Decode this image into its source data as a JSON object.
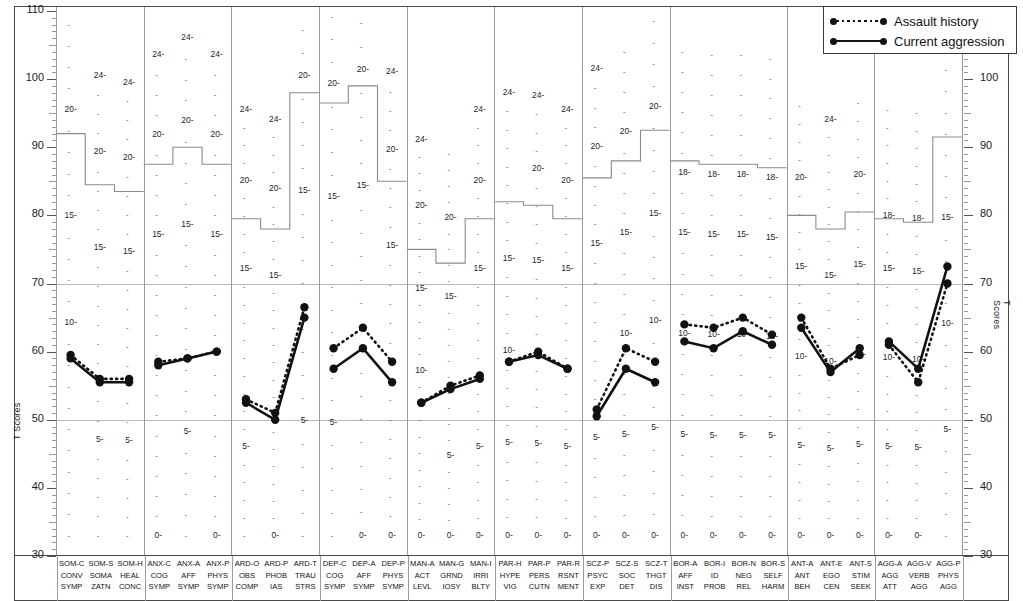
{
  "chart_data": {
    "type": "line",
    "title": "",
    "xlabel": "",
    "ylabel": "T Scores",
    "ylim": [
      30,
      110
    ],
    "grid": false,
    "legend_position": "top-right",
    "y_axis_left_ticks": [
      110,
      100,
      90,
      80,
      70,
      60,
      50,
      40,
      30
    ],
    "y_axis_right_ticks": [
      100,
      90,
      80,
      70,
      60,
      50,
      40,
      30
    ],
    "reference_lines": [
      50,
      70
    ],
    "categories": [
      "SOM-C",
      "SOM-S",
      "SOM-H",
      "ANX-C",
      "ANX-A",
      "ANX-P",
      "ARD-O",
      "ARD-P",
      "ARD-T",
      "DEP-C",
      "DEP-A",
      "DEP-P",
      "MAN-A",
      "MAN-G",
      "MAN-I",
      "PAR-H",
      "PAR-P",
      "PAR-R",
      "SCZ-P",
      "SCZ-S",
      "SCZ-T",
      "BOR-A",
      "BOR-I",
      "BOR-N",
      "BOR-S",
      "ANT-A",
      "ANT-E",
      "ANT-S",
      "AGG-A",
      "AGG-V",
      "AGG-P"
    ],
    "series": [
      {
        "name": "Assault history",
        "style": "dotted",
        "values": [
          59.5,
          56.0,
          56.0,
          58.5,
          59.0,
          60.0,
          53.0,
          51.0,
          66.5,
          60.5,
          63.5,
          58.5,
          52.5,
          55.0,
          56.5,
          58.5,
          60.0,
          57.5,
          51.5,
          60.5,
          58.5,
          64.0,
          63.5,
          65.0,
          62.5,
          65.0,
          57.5,
          59.5,
          61.0,
          55.5,
          70.0
        ]
      },
      {
        "name": "Current aggression",
        "style": "solid",
        "values": [
          59.0,
          55.5,
          55.5,
          58.0,
          59.0,
          60.0,
          52.5,
          50.0,
          65.0,
          57.5,
          60.5,
          55.5,
          52.5,
          54.5,
          56.0,
          58.5,
          59.5,
          57.5,
          50.5,
          57.5,
          55.5,
          61.5,
          60.5,
          63.0,
          61.0,
          63.5,
          57.0,
          60.5,
          61.5,
          57.5,
          72.5
        ]
      }
    ]
  },
  "legend": {
    "items": [
      {
        "label": "Assault history",
        "style": "dotted"
      },
      {
        "label": "Current aggression",
        "style": "solid"
      }
    ]
  },
  "axis": {
    "left_caption": "T Scores",
    "right_caption": "T Scores",
    "left_labels": [
      "110",
      "100",
      "90",
      "80",
      "70",
      "60",
      "50",
      "40",
      "30"
    ],
    "right_labels": [
      "100",
      "90",
      "80",
      "70",
      "60",
      "50",
      "40",
      "30"
    ]
  },
  "groups": [
    {
      "code": "SOM",
      "scales": [
        {
          "abbr": "SOM-C",
          "l1": "CONV",
          "l2": "SYMP",
          "raw_max": 24,
          "raw_labels": [
            10,
            15,
            20
          ],
          "skyline_t": 92.0
        },
        {
          "abbr": "SOM-S",
          "l1": "SOMA",
          "l2": "ZATN",
          "raw_max": 24,
          "raw_labels": [
            5,
            15,
            20,
            24
          ],
          "skyline_t": 84.5
        },
        {
          "abbr": "SOM-H",
          "l1": "HEAL",
          "l2": "CONC",
          "raw_max": 24,
          "raw_labels": [
            5,
            15,
            20,
            24
          ],
          "skyline_t": 83.5
        }
      ]
    },
    {
      "code": "ANX",
      "scales": [
        {
          "abbr": "ANX-C",
          "l1": "COG",
          "l2": "SYMP",
          "raw_max": 24,
          "raw_labels": [
            0,
            15,
            20,
            24
          ],
          "skyline_t": 87.5
        },
        {
          "abbr": "ANX-A",
          "l1": "AFF",
          "l2": "SYMP",
          "raw_max": 24,
          "raw_labels": [
            5,
            15,
            20,
            24
          ],
          "skyline_t": 90.0
        },
        {
          "abbr": "ANX-P",
          "l1": "PHYS",
          "l2": "SYMP",
          "raw_max": 24,
          "raw_labels": [
            0,
            15,
            20,
            24
          ],
          "skyline_t": 87.5
        }
      ]
    },
    {
      "code": "ARD",
      "scales": [
        {
          "abbr": "ARD-O",
          "l1": "OBS",
          "l2": "COMP",
          "raw_max": 24,
          "raw_labels": [
            5,
            15,
            20,
            24
          ],
          "skyline_t": 79.5
        },
        {
          "abbr": "ARD-P",
          "l1": "PHOB",
          "l2": "IAS",
          "raw_max": 24,
          "raw_labels": [
            0,
            15,
            20,
            24
          ],
          "skyline_t": 78.0
        },
        {
          "abbr": "ARD-T",
          "l1": "TRAU",
          "l2": "STRS",
          "raw_max": 24,
          "raw_labels": [
            5,
            15,
            20,
            24
          ],
          "skyline_t": 98.0
        }
      ]
    },
    {
      "code": "DEP",
      "scales": [
        {
          "abbr": "DEP-C",
          "l1": "COG",
          "l2": "SYMP",
          "raw_max": 24,
          "raw_labels": [
            5,
            15,
            20,
            24
          ],
          "skyline_t": 96.5
        },
        {
          "abbr": "DEP-A",
          "l1": "AFF",
          "l2": "SYMP",
          "raw_max": 24,
          "raw_labels": [
            0,
            15,
            20,
            24
          ],
          "skyline_t": 99.0
        },
        {
          "abbr": "DEP-P",
          "l1": "PHYS",
          "l2": "SYMP",
          "raw_max": 24,
          "raw_labels": [
            0,
            15,
            20,
            24
          ],
          "skyline_t": 85.0
        }
      ]
    },
    {
      "code": "MAN",
      "scales": [
        {
          "abbr": "MAN-A",
          "l1": "ACT",
          "l2": "LEVL",
          "raw_max": 24,
          "raw_labels": [
            0,
            10,
            15,
            20,
            24
          ],
          "skyline_t": 75.0
        },
        {
          "abbr": "MAN-G",
          "l1": "GRND",
          "l2": "IOSY",
          "raw_max": 24,
          "raw_labels": [
            0,
            5,
            15,
            20
          ],
          "skyline_t": 73.0
        },
        {
          "abbr": "MAN-I",
          "l1": "IRRI",
          "l2": "BLTY",
          "raw_max": 24,
          "raw_labels": [
            0,
            5,
            15,
            20,
            24
          ],
          "skyline_t": 79.5
        }
      ]
    },
    {
      "code": "PAR",
      "scales": [
        {
          "abbr": "PAR-H",
          "l1": "HYPE",
          "l2": "VIG",
          "raw_max": 24,
          "raw_labels": [
            0,
            5,
            10,
            15,
            24
          ],
          "skyline_t": 82.0
        },
        {
          "abbr": "PAR-P",
          "l1": "PERS",
          "l2": "CUTN",
          "raw_max": 24,
          "raw_labels": [
            0,
            5,
            15,
            20,
            24
          ],
          "skyline_t": 81.5
        },
        {
          "abbr": "PAR-R",
          "l1": "RSNT",
          "l2": "MENT",
          "raw_max": 24,
          "raw_labels": [
            0,
            5,
            15,
            20,
            24
          ],
          "skyline_t": 79.5
        }
      ]
    },
    {
      "code": "SCZ",
      "scales": [
        {
          "abbr": "SCZ-P",
          "l1": "PSYC",
          "l2": "EXP",
          "raw_max": 24,
          "raw_labels": [
            0,
            5,
            15,
            20,
            24
          ],
          "skyline_t": 85.5
        },
        {
          "abbr": "SCZ-S",
          "l1": "SOC",
          "l2": "DET",
          "raw_max": 24,
          "raw_labels": [
            0,
            5,
            10,
            15,
            20
          ],
          "skyline_t": 88.0
        },
        {
          "abbr": "SCZ-T",
          "l1": "THGT",
          "l2": "DIS",
          "raw_max": 24,
          "raw_labels": [
            0,
            5,
            10,
            15,
            20
          ],
          "skyline_t": 92.5
        }
      ]
    },
    {
      "code": "BOR",
      "scales": [
        {
          "abbr": "BOR-A",
          "l1": "AFF",
          "l2": "INST",
          "raw_max": 24,
          "raw_labels": [
            0,
            5,
            10,
            15,
            18
          ],
          "skyline_t": 88.0
        },
        {
          "abbr": "BOR-I",
          "l1": "ID",
          "l2": "PROB",
          "raw_max": 24,
          "raw_labels": [
            0,
            5,
            10,
            15,
            18
          ],
          "skyline_t": 87.5
        },
        {
          "abbr": "BOR-N",
          "l1": "NEG",
          "l2": "REL",
          "raw_max": 24,
          "raw_labels": [
            0,
            5,
            10,
            15,
            18
          ],
          "skyline_t": 87.5
        },
        {
          "abbr": "BOR-S",
          "l1": "SELF",
          "l2": "HARM",
          "raw_max": 24,
          "raw_labels": [
            0,
            5,
            10,
            15,
            18
          ],
          "skyline_t": 87.0
        }
      ]
    },
    {
      "code": "ANT",
      "scales": [
        {
          "abbr": "ANT-A",
          "l1": "ANT",
          "l2": "BEH",
          "raw_max": 24,
          "raw_labels": [
            0,
            5,
            10,
            15,
            20
          ],
          "skyline_t": 80.0
        },
        {
          "abbr": "ANT-E",
          "l1": "EGO",
          "l2": "CEN",
          "raw_max": 24,
          "raw_labels": [
            0,
            5,
            10,
            15,
            24
          ],
          "skyline_t": 78.0
        },
        {
          "abbr": "ANT-S",
          "l1": "STIM",
          "l2": "SEEK",
          "raw_max": 24,
          "raw_labels": [
            0,
            5,
            10,
            15,
            20
          ],
          "skyline_t": 80.5
        }
      ]
    },
    {
      "code": "AGG",
      "scales": [
        {
          "abbr": "AGG-A",
          "l1": "AGG",
          "l2": "ATT",
          "raw_max": 24,
          "raw_labels": [
            0,
            5,
            10,
            15,
            18
          ],
          "skyline_t": 79.5
        },
        {
          "abbr": "AGG-V",
          "l1": "VERB",
          "l2": "AGG",
          "raw_max": 24,
          "raw_labels": [
            0,
            5,
            10,
            15,
            18
          ],
          "skyline_t": 79.0
        },
        {
          "abbr": "AGG-P",
          "l1": "PHYS",
          "l2": "AGG",
          "raw_max": 24,
          "raw_labels": [
            5,
            10,
            15
          ],
          "skyline_t": 91.5
        }
      ]
    }
  ]
}
